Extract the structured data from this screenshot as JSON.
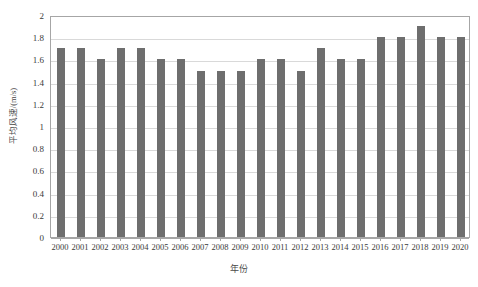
{
  "chart_data": {
    "type": "bar",
    "title": "",
    "xlabel": "年份",
    "ylabel": "平均风速/(m/s)",
    "categories": [
      "2000",
      "2001",
      "2002",
      "2003",
      "2004",
      "2005",
      "2006",
      "2007",
      "2008",
      "2009",
      "2010",
      "2011",
      "2012",
      "2013",
      "2014",
      "2015",
      "2016",
      "2017",
      "2018",
      "2019",
      "2020"
    ],
    "values": [
      1.7,
      1.7,
      1.6,
      1.7,
      1.7,
      1.6,
      1.6,
      1.5,
      1.5,
      1.5,
      1.6,
      1.6,
      1.5,
      1.7,
      1.6,
      1.6,
      1.8,
      1.8,
      1.9,
      1.8,
      1.8
    ],
    "series": [
      {
        "name": "平均风速",
        "values": [
          1.7,
          1.7,
          1.6,
          1.7,
          1.7,
          1.6,
          1.6,
          1.5,
          1.5,
          1.5,
          1.6,
          1.6,
          1.5,
          1.7,
          1.6,
          1.6,
          1.8,
          1.8,
          1.9,
          1.8,
          1.8
        ]
      }
    ],
    "ylim": [
      0,
      2
    ],
    "ytick_labels": [
      "0",
      "0.2",
      "0.4",
      "0.6",
      "0.8",
      "1",
      "1.2",
      "1.4",
      "1.6",
      "1.8",
      "2"
    ],
    "ytick_values": [
      0,
      0.2,
      0.4,
      0.6,
      0.8,
      1,
      1.2,
      1.4,
      1.6,
      1.8,
      2
    ],
    "grid": true,
    "grid_axis": "y",
    "legend": false,
    "legend_position": "none",
    "bar_color": "#6e6e6e",
    "grid_color": "#d9d9d9",
    "axis_color": "#a6a6a6",
    "plot_background": "#ffffff"
  }
}
